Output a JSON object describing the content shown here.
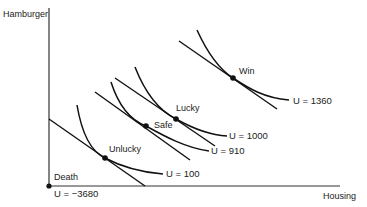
{
  "diagram": {
    "type": "indifference-curves",
    "axes": {
      "ylabel": "Hamburger",
      "xlabel": "Housing"
    },
    "origin_point": {
      "label": "Death",
      "utility_label": "U = −3680"
    },
    "outcomes": [
      {
        "id": "unlucky",
        "label": "Unlucky",
        "utility_label": "U = 100"
      },
      {
        "id": "safe",
        "label": "Safe",
        "utility_label": "U = 910"
      },
      {
        "id": "lucky",
        "label": "Lucky",
        "utility_label": "U = 1000"
      },
      {
        "id": "win",
        "label": "Win",
        "utility_label": "U = 1360"
      }
    ]
  }
}
